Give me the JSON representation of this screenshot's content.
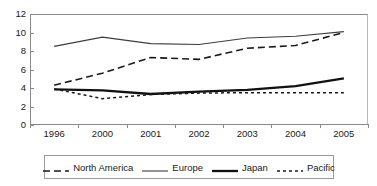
{
  "chart_data": {
    "type": "line",
    "title": "",
    "subtitle": "",
    "xlabel": "",
    "ylabel": "",
    "categories": [
      "1996",
      "2000",
      "2001",
      "2002",
      "2003",
      "2004",
      "2005"
    ],
    "ylim": [
      0,
      12
    ],
    "yticks": [
      0,
      2,
      4,
      6,
      8,
      10,
      12
    ],
    "ytick_labels": [
      "0",
      "2",
      "4",
      "6",
      "8",
      "10",
      "12"
    ],
    "grid": false,
    "legend_position": "bottom",
    "series": [
      {
        "name": "North America",
        "values": [
          4.3,
          5.6,
          7.3,
          7.1,
          8.3,
          8.6,
          10.0
        ],
        "style": "long-dash",
        "color": "#1a1a1a",
        "width": 1.6,
        "dash": "7,4"
      },
      {
        "name": "Europe",
        "values": [
          8.5,
          9.5,
          8.8,
          8.7,
          9.4,
          9.6,
          10.1
        ],
        "style": "solid-thin",
        "color": "#3d3d3d",
        "width": 1.1,
        "dash": "none"
      },
      {
        "name": "Japan",
        "values": [
          3.85,
          3.75,
          3.35,
          3.6,
          3.8,
          4.2,
          5.05
        ],
        "style": "solid-thick",
        "color": "#111111",
        "width": 2.3,
        "dash": "none"
      },
      {
        "name": "Pacific",
        "values": [
          3.9,
          2.85,
          3.3,
          3.45,
          3.5,
          3.5,
          3.5
        ],
        "style": "short-dash",
        "color": "#1a1a1a",
        "width": 1.5,
        "dash": "3,3"
      }
    ]
  },
  "legend": {
    "entries": [
      {
        "label": "North America"
      },
      {
        "label": "Europe"
      },
      {
        "label": "Japan"
      },
      {
        "label": "Pacific"
      }
    ]
  }
}
